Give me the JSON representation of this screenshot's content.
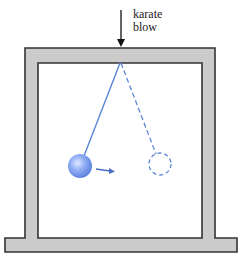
{
  "diagram": {
    "annotation": {
      "line1": "karate",
      "line2": "blow"
    },
    "elements": [
      {
        "name": "frame",
        "shape": "inverted-U frame on base",
        "fill": "#cbcbcb",
        "stroke": "#333333"
      },
      {
        "name": "force-arrow",
        "direction": "down",
        "label": "karate blow"
      },
      {
        "name": "pendulum-string",
        "style": "solid",
        "color": "#5b85d6"
      },
      {
        "name": "pendulum-bob",
        "style": "solid sphere",
        "color": "#7a9ef0"
      },
      {
        "name": "motion-arrow",
        "direction": "right",
        "color": "#4a6fc2"
      },
      {
        "name": "displaced-string",
        "style": "dashed",
        "color": "#5b85d6"
      },
      {
        "name": "displaced-bob",
        "style": "dashed circle",
        "color": "#5b85d6"
      }
    ],
    "colors": {
      "frame_fill": "#cbcbcb",
      "frame_stroke": "#333333",
      "pendulum": "#5b85d6",
      "bob": "#7a9ef0"
    }
  }
}
